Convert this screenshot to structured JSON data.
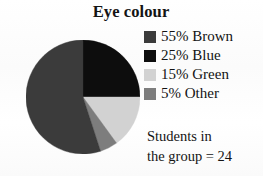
{
  "title": "Eye colour",
  "caption": {
    "line1": "Students in",
    "line2": "the group = 24"
  },
  "legend": {
    "items": [
      {
        "label": "55% Brown",
        "percent": 55,
        "category": "Brown",
        "color": "#3b3b3b",
        "swatch_name": "legend-swatch-brown"
      },
      {
        "label": "25% Blue",
        "percent": 25,
        "category": "Blue",
        "color": "#0d0d0d",
        "swatch_name": "legend-swatch-blue"
      },
      {
        "label": "15% Green",
        "percent": 15,
        "category": "Green",
        "color": "#d2d2d2",
        "swatch_name": "legend-swatch-green"
      },
      {
        "label": "5% Other",
        "percent": 5,
        "category": "Other",
        "color": "#7d7d7d",
        "swatch_name": "legend-swatch-other"
      }
    ]
  },
  "chart_data": {
    "type": "pie",
    "title": "Eye colour",
    "subtitle": "",
    "xlabel": "",
    "ylabel": "",
    "categories": [
      "Blue",
      "Green",
      "Other",
      "Brown"
    ],
    "values": [
      25,
      15,
      5,
      55
    ],
    "unit": "percent",
    "total_label": "Students in the group = 24",
    "total": 24,
    "start_angle_deg": 0,
    "direction": "clockwise",
    "legend_position": "right",
    "grid": false,
    "slices": [
      {
        "label": "25% Blue",
        "category": "Blue",
        "value": 25,
        "color": "#0d0d0d",
        "start_deg": 0,
        "end_deg": 90
      },
      {
        "label": "15% Green",
        "category": "Green",
        "value": 15,
        "color": "#d2d2d2",
        "start_deg": 90,
        "end_deg": 144
      },
      {
        "label": "5% Other",
        "category": "Other",
        "value": 5,
        "color": "#7d7d7d",
        "start_deg": 144,
        "end_deg": 162
      },
      {
        "label": "55% Brown",
        "category": "Brown",
        "value": 55,
        "color": "#3b3b3b",
        "start_deg": 162,
        "end_deg": 360
      }
    ]
  }
}
